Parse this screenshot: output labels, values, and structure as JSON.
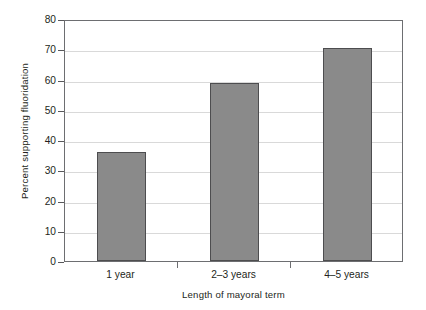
{
  "chart_data": {
    "type": "bar",
    "title": "",
    "subtitle": "",
    "xlabel": "Length of mayoral term",
    "ylabel": "Percent supporting fluoridation",
    "categories": [
      "1 year",
      "2–3 years",
      "4–5 years"
    ],
    "values": [
      36,
      59,
      70.5
    ],
    "ylim": [
      0,
      80
    ],
    "xlim_categorical": true,
    "yticks": [
      0,
      10,
      20,
      30,
      40,
      50,
      60,
      70,
      80
    ],
    "ytick_labels": [
      "0",
      "10",
      "20",
      "30",
      "40",
      "50",
      "60",
      "70",
      "80"
    ],
    "grid": "horizontal",
    "legend": "none",
    "annotations": [],
    "series": [
      {
        "name": "Percent supporting fluoridation",
        "values": [
          36,
          59,
          70.5
        ]
      }
    ],
    "colors": {
      "bar_fill": "#8a8a8a",
      "bar_edge": "#4d4d4f",
      "gridline": "#d9d9d9",
      "axis_frame": "#6d6e71",
      "text": "#231f20",
      "background": "#ffffff"
    }
  }
}
